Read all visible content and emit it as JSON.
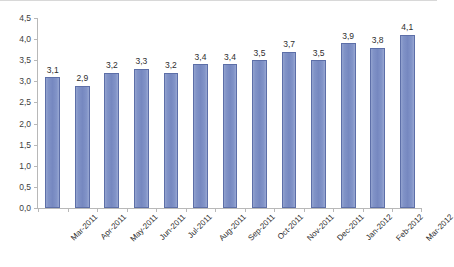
{
  "chart_data": {
    "type": "bar",
    "title": "",
    "subtitle": "",
    "xlabel": "",
    "ylabel": "",
    "categories": [
      "Mar-2011",
      "Apr-2011",
      "May-2011",
      "Jun-2011",
      "Jul-2011",
      "Aug-2011",
      "Sep-2011",
      "Oct-2011",
      "Nov-2011",
      "Dec-2011",
      "Jan-2012",
      "Feb-2012",
      "Mar-2012"
    ],
    "values": [
      3.1,
      2.9,
      3.2,
      3.3,
      3.2,
      3.4,
      3.4,
      3.5,
      3.7,
      3.5,
      3.9,
      3.8,
      4.1
    ],
    "data_labels": [
      "3,1",
      "2,9",
      "3,2",
      "3,3",
      "3,2",
      "3,4",
      "3,4",
      "3,5",
      "3,7",
      "3,5",
      "3,9",
      "3,8",
      "4,1"
    ],
    "ylim": [
      0.0,
      4.5
    ],
    "ytick_values": [
      0.0,
      0.5,
      1.0,
      1.5,
      2.0,
      2.5,
      3.0,
      3.5,
      4.0,
      4.5
    ],
    "ytick_labels": [
      "0,0",
      "0,5",
      "1,0",
      "1,5",
      "2,0",
      "2,5",
      "3,0",
      "3,5",
      "4,0",
      "4,5"
    ],
    "decimal_separator": ",",
    "grid": false,
    "legend": false,
    "legend_position": "none",
    "series": [
      {
        "name": "",
        "color": "#7688c0",
        "values": [
          3.1,
          2.9,
          3.2,
          3.3,
          3.2,
          3.4,
          3.4,
          3.5,
          3.7,
          3.5,
          3.9,
          3.8,
          4.1
        ]
      }
    ],
    "colors": {
      "bar_fill": "#7688c0",
      "bar_border": "#5d6fa8",
      "axis_line": "#b8b8b8",
      "text": "#2e2e2e",
      "background": "#ffffff"
    }
  }
}
